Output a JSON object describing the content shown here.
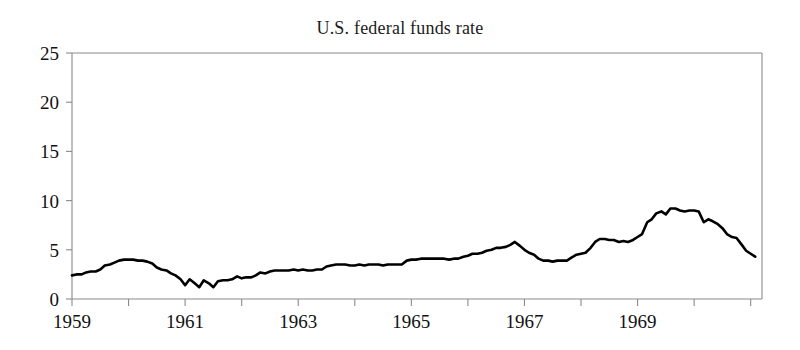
{
  "chart_data": {
    "type": "line",
    "title": "U.S. federal funds rate",
    "xlabel": "",
    "ylabel": "",
    "xlim": [
      1959.0,
      1971.2
    ],
    "ylim": [
      0,
      25
    ],
    "yticks": [
      0,
      5,
      10,
      15,
      20,
      25
    ],
    "ytick_labels": [
      "0",
      "5",
      "10",
      "15",
      "20",
      "25"
    ],
    "xticks": [
      1959,
      1960,
      1961,
      1962,
      1963,
      1964,
      1965,
      1966,
      1967,
      1968,
      1969,
      1970,
      1971
    ],
    "xtick_labels_shown": [
      "1959",
      "1961",
      "1963",
      "1965",
      "1967",
      "1969"
    ],
    "xtick_labeled_values": [
      1959,
      1961,
      1963,
      1965,
      1967,
      1969
    ],
    "grid": false,
    "legend": "none",
    "line_color": "#000000",
    "axis_color": "#8a8a8a",
    "background_color": "#ffffff",
    "series": [
      {
        "name": "Federal funds rate",
        "units": "percent",
        "x": [
          1959.0,
          1959.08,
          1959.17,
          1959.25,
          1959.33,
          1959.42,
          1959.5,
          1959.58,
          1959.67,
          1959.75,
          1959.83,
          1959.92,
          1960.0,
          1960.08,
          1960.17,
          1960.25,
          1960.33,
          1960.42,
          1960.5,
          1960.58,
          1960.67,
          1960.75,
          1960.83,
          1960.92,
          1961.0,
          1961.08,
          1961.17,
          1961.25,
          1961.33,
          1961.42,
          1961.5,
          1961.58,
          1961.67,
          1961.75,
          1961.83,
          1961.92,
          1962.0,
          1962.08,
          1962.17,
          1962.25,
          1962.33,
          1962.42,
          1962.5,
          1962.58,
          1962.67,
          1962.75,
          1962.83,
          1962.92,
          1963.0,
          1963.08,
          1963.17,
          1963.25,
          1963.33,
          1963.42,
          1963.5,
          1963.58,
          1963.67,
          1963.75,
          1963.83,
          1963.92,
          1964.0,
          1964.08,
          1964.17,
          1964.25,
          1964.33,
          1964.42,
          1964.5,
          1964.58,
          1964.67,
          1964.75,
          1964.83,
          1964.92,
          1965.0,
          1965.08,
          1965.17,
          1965.25,
          1965.33,
          1965.42,
          1965.5,
          1965.58,
          1965.67,
          1965.75,
          1965.83,
          1965.92,
          1966.0,
          1966.08,
          1966.17,
          1966.25,
          1966.33,
          1966.42,
          1966.5,
          1966.58,
          1966.67,
          1966.75,
          1966.83,
          1966.92,
          1967.0,
          1967.08,
          1967.17,
          1967.25,
          1967.33,
          1967.42,
          1967.5,
          1967.58,
          1967.67,
          1967.75,
          1967.83,
          1967.92,
          1968.0,
          1968.08,
          1968.17,
          1968.25,
          1968.33,
          1968.42,
          1968.5,
          1968.58,
          1968.67,
          1968.75,
          1968.83,
          1968.92,
          1969.0,
          1969.08,
          1969.17,
          1969.25,
          1969.33,
          1969.42,
          1969.5,
          1969.58,
          1969.67,
          1969.75,
          1969.83,
          1969.92,
          1970.0,
          1970.08,
          1970.17,
          1970.25,
          1970.33,
          1970.42,
          1970.5,
          1970.58,
          1970.67,
          1970.75,
          1970.83,
          1970.92,
          1971.0,
          1971.08
        ],
        "values": [
          2.4,
          2.5,
          2.5,
          2.7,
          2.8,
          2.8,
          3.0,
          3.4,
          3.5,
          3.7,
          3.9,
          4.0,
          4.0,
          4.0,
          3.9,
          3.9,
          3.8,
          3.6,
          3.2,
          3.0,
          2.9,
          2.6,
          2.4,
          2.0,
          1.4,
          2.0,
          1.6,
          1.2,
          1.9,
          1.6,
          1.2,
          1.8,
          1.9,
          1.9,
          2.0,
          2.3,
          2.1,
          2.2,
          2.2,
          2.4,
          2.7,
          2.6,
          2.8,
          2.9,
          2.9,
          2.9,
          2.9,
          3.0,
          2.9,
          3.0,
          2.9,
          2.9,
          3.0,
          3.0,
          3.3,
          3.4,
          3.5,
          3.5,
          3.5,
          3.4,
          3.4,
          3.5,
          3.4,
          3.5,
          3.5,
          3.5,
          3.4,
          3.5,
          3.5,
          3.5,
          3.5,
          3.9,
          4.0,
          4.0,
          4.1,
          4.1,
          4.1,
          4.1,
          4.1,
          4.1,
          4.0,
          4.1,
          4.1,
          4.3,
          4.4,
          4.6,
          4.6,
          4.7,
          4.9,
          5.0,
          5.2,
          5.2,
          5.3,
          5.5,
          5.8,
          5.4,
          5.0,
          4.7,
          4.5,
          4.1,
          3.9,
          3.9,
          3.8,
          3.9,
          3.9,
          3.9,
          4.2,
          4.5,
          4.6,
          4.7,
          5.2,
          5.8,
          6.1,
          6.1,
          6.0,
          6.0,
          5.8,
          5.9,
          5.8,
          6.0,
          6.3,
          6.6,
          7.8,
          8.1,
          8.7,
          8.9,
          8.6,
          9.2,
          9.2,
          9.0,
          8.9,
          9.0,
          9.0,
          8.9,
          7.8,
          8.1,
          7.9,
          7.6,
          7.2,
          6.6,
          6.3,
          6.2,
          5.6,
          4.9,
          4.6,
          4.3
        ]
      }
    ],
    "annotations": []
  },
  "page": {
    "title": "U.S. federal funds rate"
  }
}
